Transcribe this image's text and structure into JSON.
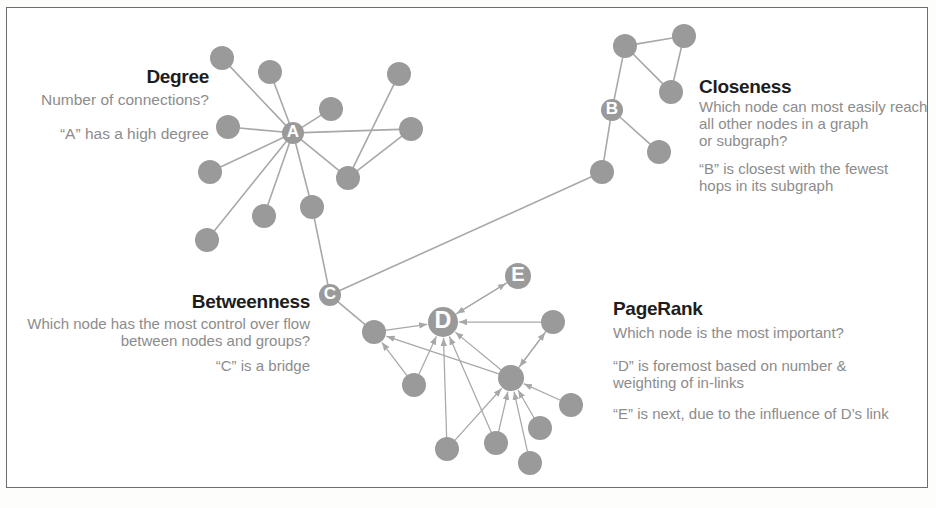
{
  "figure": {
    "kind": "network-centrality-diagram",
    "border_color": "#6e6e6e",
    "node_color": "#9a9a9a",
    "edge_color": "#a8a8a8",
    "label_color": "#8c8c8c",
    "heading_color": "#1d1d1d"
  },
  "sections": {
    "degree": {
      "heading": "Degree",
      "question": "Number of connections?",
      "answer": "“A” has a high degree"
    },
    "closeness": {
      "heading": "Closeness",
      "question": "Which node can most easily reach\nall other  nodes in a graph\nor subgraph?",
      "answer": "“B” is closest with the fewest\nhops in its  subgraph"
    },
    "betweenness": {
      "heading": "Betweenness",
      "question": "Which node has the most control over flow\nbetween nodes and groups?",
      "answer": "“C”  is  a bridge"
    },
    "pagerank": {
      "heading": "PageRank",
      "question": "Which node is the most important?",
      "answer": "“D” is foremost based on number &\nweighting of in-links",
      "answer2": "“E” is next, due to the influence of D’s link"
    }
  },
  "chart_data": {
    "type": "scatter",
    "title": "",
    "labeled_nodes": [
      "A",
      "B",
      "C",
      "D",
      "E"
    ],
    "nodes": [
      {
        "id": "d1",
        "x": 222,
        "y": 58,
        "r": 12,
        "label": ""
      },
      {
        "id": "d2",
        "x": 270,
        "y": 72,
        "r": 12,
        "label": ""
      },
      {
        "id": "d3",
        "x": 331,
        "y": 109,
        "r": 12,
        "label": ""
      },
      {
        "id": "d4",
        "x": 399,
        "y": 74,
        "r": 12,
        "label": ""
      },
      {
        "id": "d5",
        "x": 411,
        "y": 129,
        "r": 12,
        "label": ""
      },
      {
        "id": "d6",
        "x": 228,
        "y": 127,
        "r": 12,
        "label": ""
      },
      {
        "id": "d7",
        "x": 210,
        "y": 172,
        "r": 12,
        "label": ""
      },
      {
        "id": "d8",
        "x": 207,
        "y": 240,
        "r": 12,
        "label": ""
      },
      {
        "id": "d9",
        "x": 264,
        "y": 216,
        "r": 12,
        "label": ""
      },
      {
        "id": "d10",
        "x": 312,
        "y": 207,
        "r": 12,
        "label": ""
      },
      {
        "id": "d11",
        "x": 348,
        "y": 178,
        "r": 12,
        "label": ""
      },
      {
        "id": "A",
        "x": 293,
        "y": 133,
        "r": 11,
        "label": "A"
      },
      {
        "id": "C",
        "x": 330,
        "y": 295,
        "r": 11,
        "label": "C"
      },
      {
        "id": "b1",
        "x": 625,
        "y": 46,
        "r": 12,
        "label": ""
      },
      {
        "id": "b2",
        "x": 684,
        "y": 36,
        "r": 12,
        "label": ""
      },
      {
        "id": "b3",
        "x": 671,
        "y": 92,
        "r": 12,
        "label": ""
      },
      {
        "id": "B",
        "x": 612,
        "y": 110,
        "r": 11,
        "label": "B"
      },
      {
        "id": "b4",
        "x": 659,
        "y": 152,
        "r": 12,
        "label": ""
      },
      {
        "id": "b5",
        "x": 602,
        "y": 172,
        "r": 12,
        "label": ""
      },
      {
        "id": "D",
        "x": 443,
        "y": 322,
        "r": 15,
        "label": "D"
      },
      {
        "id": "E",
        "x": 518,
        "y": 276,
        "r": 13,
        "label": "E"
      },
      {
        "id": "p1",
        "x": 374,
        "y": 332,
        "r": 12,
        "label": ""
      },
      {
        "id": "p2",
        "x": 414,
        "y": 385,
        "r": 12,
        "label": ""
      },
      {
        "id": "p3",
        "x": 511,
        "y": 378,
        "r": 13,
        "label": ""
      },
      {
        "id": "p4",
        "x": 553,
        "y": 322,
        "r": 12,
        "label": ""
      },
      {
        "id": "p5",
        "x": 571,
        "y": 405,
        "r": 12,
        "label": ""
      },
      {
        "id": "p6",
        "x": 540,
        "y": 428,
        "r": 12,
        "label": ""
      },
      {
        "id": "p7",
        "x": 496,
        "y": 443,
        "r": 12,
        "label": ""
      },
      {
        "id": "p8",
        "x": 530,
        "y": 463,
        "r": 12,
        "label": ""
      },
      {
        "id": "p9",
        "x": 447,
        "y": 449,
        "r": 12,
        "label": ""
      }
    ],
    "edges": [
      {
        "from": "A",
        "to": "d1",
        "directed": false
      },
      {
        "from": "A",
        "to": "d2",
        "directed": false
      },
      {
        "from": "A",
        "to": "d3",
        "directed": false
      },
      {
        "from": "A",
        "to": "d5",
        "directed": false
      },
      {
        "from": "A",
        "to": "d6",
        "directed": false
      },
      {
        "from": "A",
        "to": "d7",
        "directed": false
      },
      {
        "from": "A",
        "to": "d8",
        "directed": false
      },
      {
        "from": "A",
        "to": "d9",
        "directed": false
      },
      {
        "from": "A",
        "to": "d10",
        "directed": false
      },
      {
        "from": "A",
        "to": "d11",
        "directed": false
      },
      {
        "from": "d11",
        "to": "d4",
        "directed": false
      },
      {
        "from": "d11",
        "to": "d5",
        "directed": false
      },
      {
        "from": "d10",
        "to": "C",
        "directed": false
      },
      {
        "from": "C",
        "to": "b5",
        "directed": false
      },
      {
        "from": "C",
        "to": "p1",
        "directed": false
      },
      {
        "from": "b1",
        "to": "b2",
        "directed": false
      },
      {
        "from": "b1",
        "to": "b3",
        "directed": false
      },
      {
        "from": "b2",
        "to": "b3",
        "directed": false
      },
      {
        "from": "b1",
        "to": "B",
        "directed": false
      },
      {
        "from": "B",
        "to": "b4",
        "directed": false
      },
      {
        "from": "B",
        "to": "b5",
        "directed": false
      },
      {
        "from": "D",
        "to": "E",
        "directed": true
      },
      {
        "from": "E",
        "to": "D",
        "directed": true
      },
      {
        "from": "p4",
        "to": "D",
        "directed": true
      },
      {
        "from": "p1",
        "to": "D",
        "directed": true
      },
      {
        "from": "p2",
        "to": "D",
        "directed": true
      },
      {
        "from": "p9",
        "to": "D",
        "directed": true
      },
      {
        "from": "p7",
        "to": "D",
        "directed": true
      },
      {
        "from": "p3",
        "to": "D",
        "directed": true
      },
      {
        "from": "p3",
        "to": "p1",
        "directed": true
      },
      {
        "from": "p3",
        "to": "p4",
        "directed": true
      },
      {
        "from": "p4",
        "to": "p3",
        "directed": true
      },
      {
        "from": "p5",
        "to": "p3",
        "directed": true
      },
      {
        "from": "p6",
        "to": "p3",
        "directed": true
      },
      {
        "from": "p8",
        "to": "p3",
        "directed": true
      },
      {
        "from": "p9",
        "to": "p3",
        "directed": true
      },
      {
        "from": "p7",
        "to": "p3",
        "directed": true
      },
      {
        "from": "p2",
        "to": "p1",
        "directed": true
      }
    ]
  }
}
